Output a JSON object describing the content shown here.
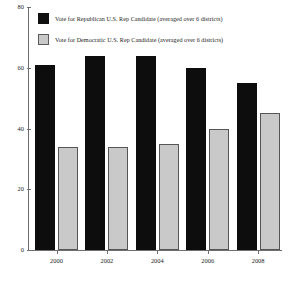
{
  "chart_data": {
    "type": "bar",
    "title": "",
    "xlabel": "",
    "ylabel": "",
    "categories": [
      "2000",
      "2002",
      "2004",
      "2006",
      "2008"
    ],
    "series": [
      {
        "name": "Vote for Republican U.S. Rep Candidate (averaged over 6 districts)",
        "color": "#0d0d0d",
        "values": [
          61,
          64,
          64,
          60,
          55
        ]
      },
      {
        "name": "Vote for Democratic U.S. Rep Candidate (averaged over 6 districts)",
        "color": "#c9c9c9",
        "values": [
          34,
          34,
          35,
          40,
          45
        ]
      }
    ],
    "ylim": [
      0,
      80
    ],
    "yticks": [
      0,
      20,
      40,
      60,
      80
    ],
    "ytick_labels": [
      "0",
      "20",
      "40",
      "60",
      "80"
    ],
    "grid": false,
    "legend_position": "top-left-inside"
  },
  "legend": {
    "items": [
      {
        "swatch": "black-square-swatch",
        "label": "Vote for Republican U.S. Rep Candidate (averaged over 6 districts)"
      },
      {
        "swatch": "gray-square-swatch",
        "label": "Vote for Democratic U.S. Rep Candidate (averaged over 6 districts)"
      }
    ]
  },
  "axes": {
    "y_tick_labels": [
      "80",
      "60",
      "40",
      "20",
      "0"
    ],
    "x_tick_labels": [
      "2000",
      "2002",
      "2004",
      "2006",
      "2008"
    ]
  }
}
